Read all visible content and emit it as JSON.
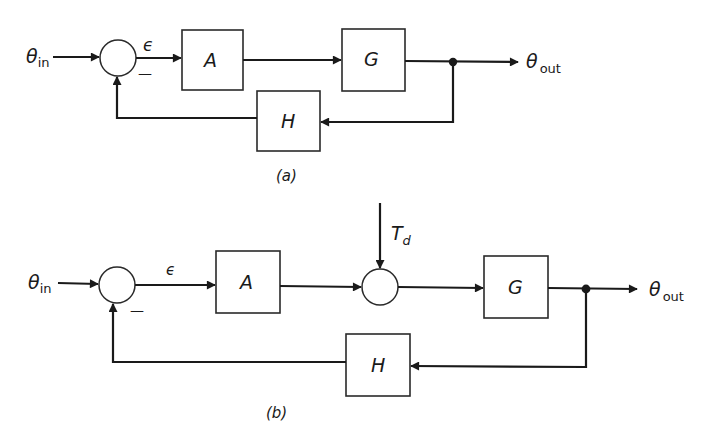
{
  "diagram_a": {
    "caption": "(a)",
    "input": {
      "symbol": "θ",
      "subscript": "in"
    },
    "output": {
      "symbol": "θ",
      "subscript": "out"
    },
    "error_label": "ϵ",
    "minus_sign": "—",
    "blocks": {
      "A": "A",
      "G": "G",
      "H": "H"
    }
  },
  "diagram_b": {
    "caption": "(b)",
    "input": {
      "symbol": "θ",
      "subscript": "in"
    },
    "output": {
      "symbol": "θ",
      "subscript": "out"
    },
    "error_label": "ϵ",
    "minus_sign": "—",
    "disturbance": {
      "symbol": "T",
      "subscript": "d"
    },
    "blocks": {
      "A": "A",
      "G": "G",
      "H": "H"
    }
  },
  "colors": {
    "line": "#1a1a1a",
    "background": "#ffffff"
  }
}
